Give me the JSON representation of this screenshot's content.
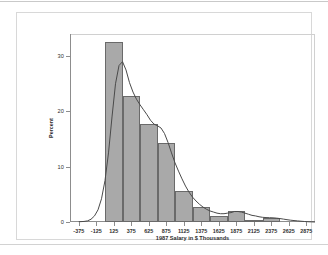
{
  "figure": {
    "x_axis_title": "1987 Salary in $ Thousands",
    "y_axis_title": "Percent"
  },
  "chart_data": {
    "type": "bar",
    "title": "",
    "xlabel": "1987 Salary in $ Thousands",
    "ylabel": "Percent",
    "xlim": [
      -500,
      3000
    ],
    "ylim": [
      0,
      34
    ],
    "grid": false,
    "legend": "none",
    "bin_width": 250,
    "xticks": [
      -375,
      -125,
      125,
      375,
      625,
      875,
      1125,
      1375,
      1625,
      1875,
      2125,
      2375,
      2625,
      2875
    ],
    "xtick_labels": [
      "-375",
      "-125",
      "125",
      "375",
      "625",
      "875",
      "1125",
      "1375",
      "1625",
      "1875",
      "2125",
      "2375",
      "2625",
      "2875"
    ],
    "yticks": [
      0,
      10,
      20,
      30
    ],
    "ytick_labels": [
      "0",
      "10",
      "20",
      "30"
    ],
    "bars": [
      {
        "center": 125,
        "left": 0,
        "right": 250,
        "value": 32.5
      },
      {
        "center": 375,
        "left": 250,
        "right": 500,
        "value": 22.8
      },
      {
        "center": 625,
        "left": 500,
        "right": 750,
        "value": 17.8
      },
      {
        "center": 875,
        "left": 750,
        "right": 1000,
        "value": 14.2
      },
      {
        "center": 1125,
        "left": 1000,
        "right": 1250,
        "value": 5.6
      },
      {
        "center": 1375,
        "left": 1250,
        "right": 1500,
        "value": 2.8
      },
      {
        "center": 1625,
        "left": 1500,
        "right": 1750,
        "value": 1.0
      },
      {
        "center": 1875,
        "left": 1750,
        "right": 2000,
        "value": 2.0
      },
      {
        "center": 2125,
        "left": 2000,
        "right": 2250,
        "value": 0.4
      },
      {
        "center": 2375,
        "left": 2250,
        "right": 2500,
        "value": 0.8
      }
    ],
    "overlay_curve": {
      "name": "kernel density",
      "points": [
        [
          -375,
          0.05
        ],
        [
          -300,
          0.1
        ],
        [
          -250,
          0.2
        ],
        [
          -200,
          0.5
        ],
        [
          -150,
          1.1
        ],
        [
          -100,
          2.2
        ],
        [
          -50,
          4.2
        ],
        [
          0,
          7.5
        ],
        [
          50,
          12.5
        ],
        [
          100,
          19.0
        ],
        [
          150,
          25.0
        ],
        [
          200,
          28.3
        ],
        [
          250,
          29.0
        ],
        [
          300,
          27.5
        ],
        [
          350,
          25.2
        ],
        [
          400,
          23.5
        ],
        [
          450,
          22.2
        ],
        [
          500,
          21.2
        ],
        [
          550,
          20.3
        ],
        [
          600,
          19.4
        ],
        [
          650,
          18.4
        ],
        [
          700,
          17.7
        ],
        [
          750,
          17.4
        ],
        [
          800,
          17.0
        ],
        [
          850,
          16.0
        ],
        [
          900,
          14.4
        ],
        [
          950,
          12.5
        ],
        [
          1000,
          10.7
        ],
        [
          1050,
          9.2
        ],
        [
          1100,
          7.8
        ],
        [
          1150,
          6.5
        ],
        [
          1200,
          5.4
        ],
        [
          1250,
          4.5
        ],
        [
          1300,
          3.8
        ],
        [
          1350,
          3.2
        ],
        [
          1400,
          2.7
        ],
        [
          1450,
          2.3
        ],
        [
          1500,
          2.0
        ],
        [
          1550,
          1.8
        ],
        [
          1600,
          1.6
        ],
        [
          1650,
          1.5
        ],
        [
          1700,
          1.5
        ],
        [
          1750,
          1.6
        ],
        [
          1800,
          1.7
        ],
        [
          1850,
          1.9
        ],
        [
          1900,
          1.9
        ],
        [
          1950,
          1.8
        ],
        [
          2000,
          1.6
        ],
        [
          2050,
          1.4
        ],
        [
          2100,
          1.2
        ],
        [
          2150,
          1.1
        ],
        [
          2200,
          0.95
        ],
        [
          2250,
          0.85
        ],
        [
          2300,
          0.8
        ],
        [
          2350,
          0.78
        ],
        [
          2400,
          0.75
        ],
        [
          2450,
          0.7
        ],
        [
          2500,
          0.62
        ],
        [
          2550,
          0.52
        ],
        [
          2600,
          0.42
        ],
        [
          2650,
          0.33
        ],
        [
          2700,
          0.26
        ],
        [
          2750,
          0.2
        ],
        [
          2800,
          0.14
        ],
        [
          2850,
          0.09
        ],
        [
          2900,
          0.05
        ],
        [
          2950,
          0.02
        ],
        [
          3000,
          0.0
        ]
      ]
    },
    "colors": {
      "bar_fill": "#a9a9a9",
      "bar_edge": "#6a6a6a",
      "curve": "#4a4a4a",
      "axis": "#8d8d8d",
      "text": "#2f2f2f",
      "background": "#ffffff"
    }
  }
}
